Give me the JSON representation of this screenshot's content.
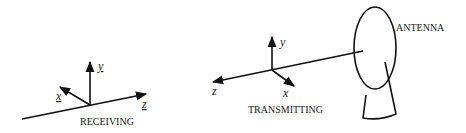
{
  "diagram": {
    "type": "antenna-coordinate-systems",
    "receiving": {
      "caption": "RECEIVING",
      "axes": {
        "x": "x",
        "y": "y",
        "z": "z"
      },
      "axis_labels_underlined": true
    },
    "transmitting": {
      "caption": "TRANSMITTING",
      "axes": {
        "x": "x",
        "y": "y",
        "z": "z"
      },
      "axis_labels_underlined": false
    },
    "antenna": {
      "label": "ANTENNA"
    },
    "colors": {
      "stroke": "#111111",
      "background": "#ffffff"
    }
  }
}
